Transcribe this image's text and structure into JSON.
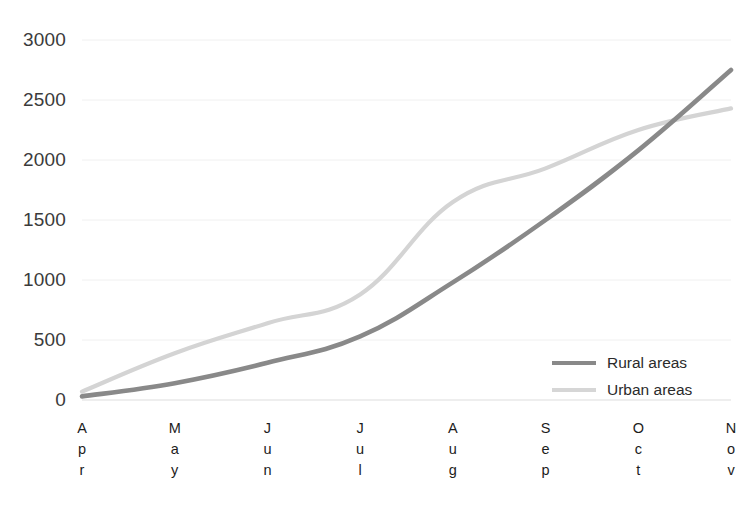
{
  "chart_data": {
    "type": "line",
    "title": "",
    "xlabel": "",
    "ylabel": "",
    "categories": [
      "Apr",
      "May",
      "Jun",
      "Jul",
      "Aug",
      "Sep",
      "Oct",
      "Nov"
    ],
    "y_ticks": [
      0,
      500,
      1000,
      1500,
      2000,
      2500,
      3000
    ],
    "ylim": [
      0,
      3000
    ],
    "grid": true,
    "legend_position": "inside-bottom-right",
    "series": [
      {
        "name": "Rural areas",
        "color": "#898989",
        "values": [
          30,
          140,
          310,
          530,
          980,
          1500,
          2080,
          2750
        ]
      },
      {
        "name": "Urban areas",
        "color": "#d4d4d4",
        "values": [
          70,
          390,
          640,
          880,
          1650,
          1930,
          2250,
          2430
        ]
      }
    ]
  },
  "axis": {
    "y_tick_labels": [
      "3000",
      "2500",
      "2000",
      "1500",
      "1000",
      "500",
      "0"
    ],
    "x_tick_labels": [
      {
        "letters": [
          "A",
          "p",
          "r"
        ]
      },
      {
        "letters": [
          "M",
          "a",
          "y"
        ]
      },
      {
        "letters": [
          "J",
          "u",
          "n"
        ]
      },
      {
        "letters": [
          "J",
          "u",
          "l"
        ]
      },
      {
        "letters": [
          "A",
          "u",
          "g"
        ]
      },
      {
        "letters": [
          "S",
          "e",
          "p"
        ]
      },
      {
        "letters": [
          "O",
          "c",
          "t"
        ]
      },
      {
        "letters": [
          "N",
          "o",
          "v"
        ]
      }
    ]
  },
  "legend": {
    "items": [
      {
        "label": "Rural areas",
        "color": "#898989"
      },
      {
        "label": "Urban areas",
        "color": "#d6d6d6"
      }
    ]
  },
  "style": {
    "grid_color": "#f0f0f0",
    "axis_color": "#e8e8e8",
    "tick_text_color": "#3b3b3b",
    "background": "#ffffff"
  }
}
